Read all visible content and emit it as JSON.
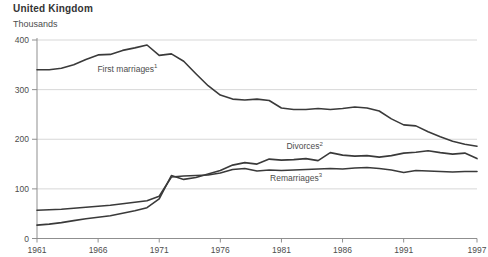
{
  "header": {
    "region": "United Kingdom",
    "unit": "Thousands"
  },
  "chart_data": {
    "type": "line",
    "title": "United Kingdom",
    "ylabel": "Thousands",
    "xlim": [
      1961,
      1997
    ],
    "ylim": [
      0,
      400
    ],
    "x_ticks": [
      1961,
      1966,
      1971,
      1976,
      1981,
      1986,
      1991,
      1997
    ],
    "y_ticks": [
      0,
      100,
      200,
      300,
      400
    ],
    "grid": "horizontal",
    "legend_position": "inline-labels",
    "x": [
      1961,
      1962,
      1963,
      1964,
      1965,
      1966,
      1967,
      1968,
      1969,
      1970,
      1971,
      1972,
      1973,
      1974,
      1975,
      1976,
      1977,
      1978,
      1979,
      1980,
      1981,
      1982,
      1983,
      1984,
      1985,
      1986,
      1987,
      1988,
      1989,
      1990,
      1991,
      1992,
      1993,
      1994,
      1995,
      1996,
      1997
    ],
    "series": [
      {
        "name": "First marriages",
        "sup": "1",
        "values": [
          340,
          340,
          343,
          350,
          361,
          370,
          371,
          379,
          384,
          390,
          369,
          372,
          357,
          332,
          308,
          289,
          281,
          279,
          281,
          278,
          263,
          260,
          260,
          262,
          260,
          262,
          265,
          263,
          257,
          241,
          229,
          227,
          215,
          205,
          196,
          190,
          186
        ]
      },
      {
        "name": "Divorces",
        "sup": "2",
        "values": [
          27,
          29,
          32,
          36,
          40,
          43,
          46,
          51,
          56,
          62,
          80,
          127,
          119,
          123,
          130,
          137,
          148,
          153,
          150,
          160,
          158,
          159,
          161,
          157,
          173,
          168,
          166,
          167,
          164,
          167,
          172,
          174,
          177,
          173,
          170,
          172,
          161
        ]
      },
      {
        "name": "Remarriages",
        "sup": "3",
        "values": [
          57,
          58,
          59,
          61,
          63,
          65,
          67,
          70,
          73,
          76,
          85,
          124,
          126,
          127,
          128,
          132,
          139,
          141,
          136,
          138,
          137,
          138,
          139,
          140,
          141,
          140,
          142,
          143,
          141,
          138,
          133,
          137,
          136,
          135,
          134,
          135,
          135
        ]
      }
    ],
    "annotations": [
      {
        "text": "First marriages",
        "sup": "1",
        "year": 1968.4,
        "value": 342
      },
      {
        "text": "Divorces",
        "sup": "2",
        "year": 1982.9,
        "value": 186
      },
      {
        "text": "Remarriages",
        "sup": "3",
        "year": 1982.2,
        "value": 122
      }
    ],
    "colors": {
      "line": "#3a3a3a",
      "grid": "#d7d7d7",
      "axis": "#8f8f8f",
      "text": "#4d4d4d"
    }
  }
}
